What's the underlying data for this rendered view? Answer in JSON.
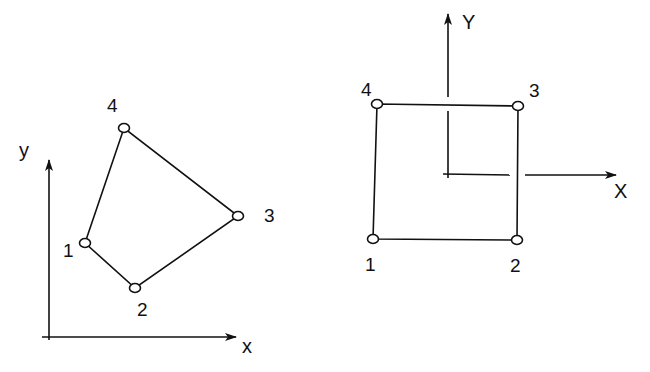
{
  "left_diagram": {
    "description": "Arbitrary quadrilateral element in global x-y coordinates",
    "axes": {
      "x_label": "x",
      "y_label": "y"
    },
    "nodes": [
      {
        "id": "1",
        "label": "1",
        "x": 85,
        "y": 243
      },
      {
        "id": "2",
        "label": "2",
        "x": 135,
        "y": 288
      },
      {
        "id": "3",
        "label": "3",
        "x": 238,
        "y": 216
      },
      {
        "id": "4",
        "label": "4",
        "x": 124,
        "y": 128
      }
    ]
  },
  "right_diagram": {
    "description": "Mapped square element in local X-Y coordinates",
    "axes": {
      "x_label": "X",
      "y_label": "Y"
    },
    "nodes": [
      {
        "id": "1",
        "label": "1",
        "x": 373,
        "y": 239
      },
      {
        "id": "2",
        "label": "2",
        "x": 517,
        "y": 240
      },
      {
        "id": "3",
        "label": "3",
        "x": 518,
        "y": 106
      },
      {
        "id": "4",
        "label": "4",
        "x": 377,
        "y": 104
      }
    ]
  },
  "colors": {
    "line": "#111111",
    "background": "#ffffff"
  }
}
